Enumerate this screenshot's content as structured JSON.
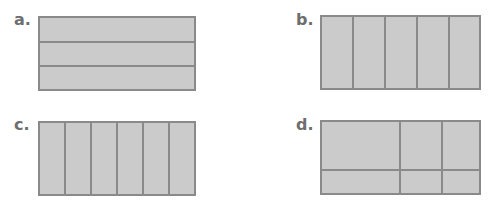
{
  "figures": [
    {
      "label": "a.",
      "description": "rectangle divided into 3 equal horizontal strips",
      "parts": 3
    },
    {
      "label": "b.",
      "description": "rectangle divided into 5 equal vertical strips",
      "parts": 5
    },
    {
      "label": "c.",
      "description": "rectangle divided into 6 equal vertical strips",
      "parts": 6
    },
    {
      "label": "d.",
      "description": "rectangle divided into 6 unequal parts by 2 vertical lines and 1 horizontal line",
      "parts": 6
    }
  ],
  "colors": {
    "fill": "#cbcbcb",
    "line": "#8a8a8a",
    "label": "#6e6e6e"
  }
}
